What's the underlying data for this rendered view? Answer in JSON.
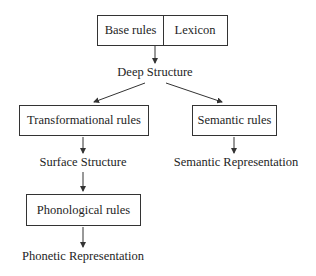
{
  "diagram": {
    "nodes": {
      "base_rules": "Base rules",
      "lexicon": "Lexicon",
      "deep_structure": "Deep Structure",
      "transformational_rules": "Transformational rules",
      "semantic_rules": "Semantic rules",
      "surface_structure": "Surface Structure",
      "semantic_representation": "Semantic Representation",
      "phonological_rules": "Phonological rules",
      "phonetic_representation": "Phonetic Representation"
    },
    "edges": [
      {
        "from": "base_rules|lexicon",
        "to": "deep_structure"
      },
      {
        "from": "deep_structure",
        "to": "transformational_rules"
      },
      {
        "from": "deep_structure",
        "to": "semantic_rules"
      },
      {
        "from": "transformational_rules",
        "to": "surface_structure"
      },
      {
        "from": "semantic_rules",
        "to": "semantic_representation"
      },
      {
        "from": "surface_structure",
        "to": "phonological_rules"
      },
      {
        "from": "phonological_rules",
        "to": "phonetic_representation"
      }
    ]
  }
}
